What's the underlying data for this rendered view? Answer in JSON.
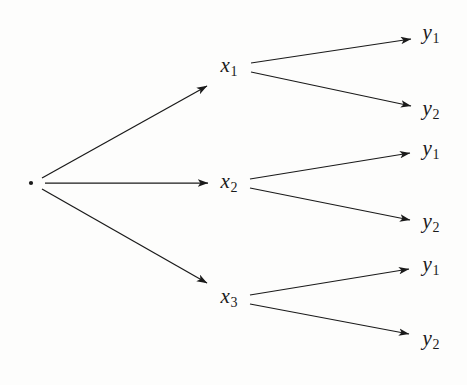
{
  "diagram": {
    "type": "tree-diagram",
    "background_color": "#fdfdfc",
    "stroke_color": "#1a1a1a",
    "root": {
      "name": "root-node",
      "label": "",
      "x": 31,
      "y": 183,
      "marker": "dot"
    },
    "level1": [
      {
        "id": "x1",
        "base": "x",
        "subscript": "1",
        "x": 229,
        "y": 67
      },
      {
        "id": "x2",
        "base": "x",
        "subscript": "2",
        "x": 229,
        "y": 183
      },
      {
        "id": "x3",
        "base": "x",
        "subscript": "3",
        "x": 229,
        "y": 298
      }
    ],
    "level2": [
      {
        "id": "y1a",
        "base": "y",
        "subscript": "1",
        "x": 431,
        "y": 34,
        "parent": "x1"
      },
      {
        "id": "y2a",
        "base": "y",
        "subscript": "2",
        "x": 431,
        "y": 110,
        "parent": "x1"
      },
      {
        "id": "y1b",
        "base": "y",
        "subscript": "1",
        "x": 431,
        "y": 150,
        "parent": "x2"
      },
      {
        "id": "y2b",
        "base": "y",
        "subscript": "2",
        "x": 431,
        "y": 223,
        "parent": "x2"
      },
      {
        "id": "y1c",
        "base": "y",
        "subscript": "1",
        "x": 431,
        "y": 266,
        "parent": "x3"
      },
      {
        "id": "y2c",
        "base": "y",
        "subscript": "2",
        "x": 431,
        "y": 340,
        "parent": "x3"
      }
    ],
    "edges": [
      {
        "id": "root-to-x1",
        "from": "root",
        "to": "x1",
        "x1": 42,
        "y1": 178,
        "x2": 207,
        "y2": 86
      },
      {
        "id": "root-to-x2",
        "from": "root",
        "to": "x2",
        "x1": 45,
        "y1": 183,
        "x2": 208,
        "y2": 183
      },
      {
        "id": "root-to-x3",
        "from": "root",
        "to": "x3",
        "x1": 42,
        "y1": 189,
        "x2": 207,
        "y2": 283
      },
      {
        "id": "x1-to-y1a",
        "from": "x1",
        "to": "y1a",
        "x1": 251,
        "y1": 63,
        "x2": 411,
        "y2": 39
      },
      {
        "id": "x1-to-y2a",
        "from": "x1",
        "to": "y2a",
        "x1": 251,
        "y1": 72,
        "x2": 411,
        "y2": 106
      },
      {
        "id": "x2-to-y1b",
        "from": "x2",
        "to": "y1b",
        "x1": 250,
        "y1": 179,
        "x2": 410,
        "y2": 153
      },
      {
        "id": "x2-to-y2b",
        "from": "x2",
        "to": "y2b",
        "x1": 250,
        "y1": 188,
        "x2": 410,
        "y2": 220
      },
      {
        "id": "x3-to-y1c",
        "from": "x3",
        "to": "y1c",
        "x1": 250,
        "y1": 295,
        "x2": 409,
        "y2": 269
      },
      {
        "id": "x3-to-y2c",
        "from": "x3",
        "to": "y2c",
        "x1": 250,
        "y1": 304,
        "x2": 409,
        "y2": 334
      }
    ]
  }
}
